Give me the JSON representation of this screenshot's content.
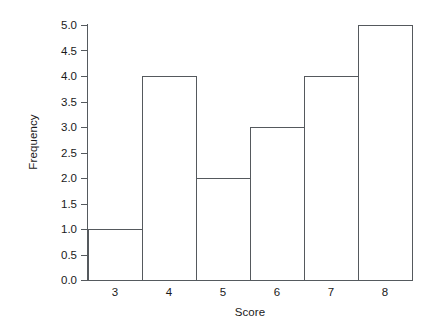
{
  "chart_data": {
    "type": "bar",
    "title": "",
    "subtitle": "",
    "xlabel": "Score",
    "ylabel": "Frequency",
    "categories": [
      "3",
      "4",
      "5",
      "6",
      "7",
      "8"
    ],
    "values": [
      1,
      4,
      2,
      3,
      4,
      5
    ],
    "series": [
      {
        "name": "Frequency",
        "values": [
          1,
          4,
          2,
          3,
          4,
          5
        ]
      }
    ],
    "ylim": [
      0,
      5
    ],
    "xlim": [
      2.5,
      8.5
    ],
    "yticks": [
      "0.0",
      "0.5",
      "1.0",
      "1.5",
      "2.0",
      "2.5",
      "3.0",
      "3.5",
      "4.0",
      "4.5",
      "5.0"
    ],
    "ytick_values": [
      0,
      0.5,
      1,
      1.5,
      2,
      2.5,
      3,
      3.5,
      4,
      4.5,
      5
    ],
    "xticks": [
      "3",
      "4",
      "5",
      "6",
      "7",
      "8"
    ],
    "grid": false,
    "legend": "none",
    "bar_style": "outlined-adjacent",
    "colors": {
      "background": "#ffffff",
      "bar_fill": "#ffffff",
      "bar_edge": "#55595d",
      "axis": "#555a5e",
      "text": "#1a1a1a"
    },
    "annotations": []
  }
}
